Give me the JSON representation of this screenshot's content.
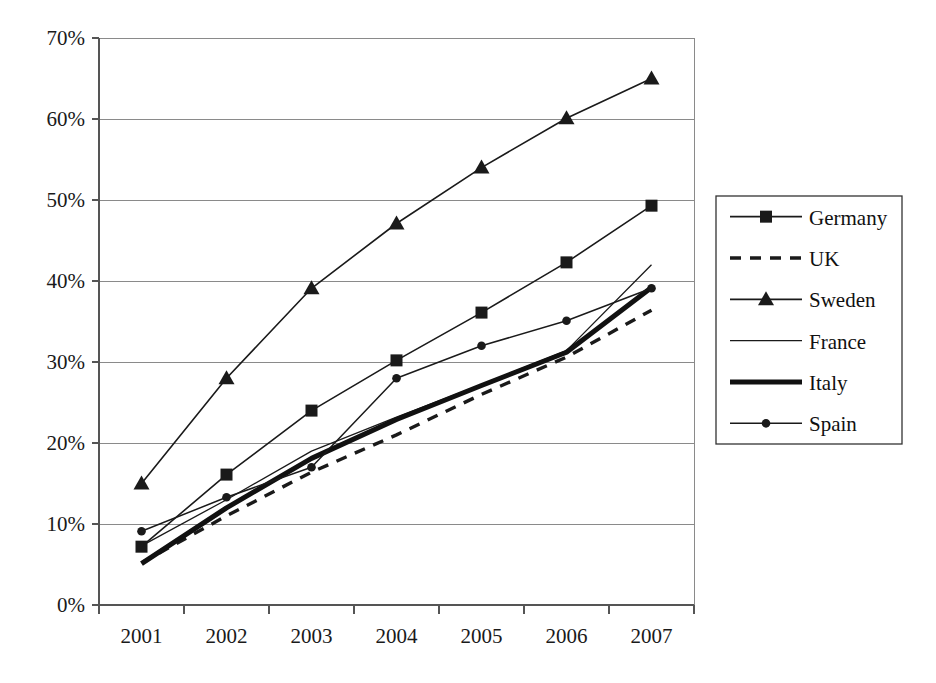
{
  "chart_data": {
    "type": "line",
    "title": "",
    "subtitle": "",
    "xlabel": "",
    "ylabel": "",
    "categories": [
      "2001",
      "2002",
      "2003",
      "2004",
      "2005",
      "2006",
      "2007"
    ],
    "x_tick_labels": [
      "2001",
      "2002",
      "2003",
      "2004",
      "2005",
      "2006",
      "2007"
    ],
    "y_tick_labels": [
      "0%",
      "10%",
      "20%",
      "30%",
      "40%",
      "50%",
      "60%",
      "70%"
    ],
    "y_tick_values": [
      0,
      10,
      20,
      30,
      40,
      50,
      60,
      70
    ],
    "ylim": [
      0,
      70
    ],
    "grid": "horizontal",
    "legend_position": "right",
    "value_unit": "percent",
    "series": [
      {
        "name": "Germany",
        "marker": "square",
        "line_style": "solid",
        "line_width": 1.6,
        "color": "#1a1a1a",
        "values": [
          7.2,
          16.1,
          24.0,
          30.2,
          36.1,
          42.3,
          49.3
        ]
      },
      {
        "name": "UK",
        "marker": "none",
        "line_style": "dashed",
        "line_width": 3.4,
        "color": "#1a1a1a",
        "values": [
          5.2,
          11.0,
          16.4,
          21.0,
          26.0,
          30.6,
          36.4
        ]
      },
      {
        "name": "Sweden",
        "marker": "triangle",
        "line_style": "solid",
        "line_width": 1.6,
        "color": "#1a1a1a",
        "values": [
          15.0,
          28.0,
          39.1,
          47.1,
          54.0,
          60.1,
          65.0
        ]
      },
      {
        "name": "France",
        "marker": "none",
        "line_style": "solid",
        "line_width": 1.3,
        "color": "#1a1a1a",
        "values": [
          7.3,
          13.0,
          19.0,
          23.2,
          27.2,
          31.4,
          42.0
        ]
      },
      {
        "name": "Italy",
        "marker": "none",
        "line_style": "solid",
        "line_width": 5.0,
        "color": "#111111",
        "values": [
          5.1,
          12.0,
          18.1,
          22.9,
          27.1,
          31.2,
          39.2
        ]
      },
      {
        "name": "Spain",
        "marker": "dot",
        "line_style": "solid",
        "line_width": 1.5,
        "color": "#1a1a1a",
        "values": [
          9.1,
          13.3,
          17.0,
          28.0,
          32.0,
          35.1,
          39.1
        ]
      }
    ]
  },
  "legend": {
    "entries": [
      {
        "label": "Germany"
      },
      {
        "label": "UK"
      },
      {
        "label": "Sweden"
      },
      {
        "label": "France"
      },
      {
        "label": "Italy"
      },
      {
        "label": "Spain"
      }
    ]
  },
  "colors": {
    "ink": "#1a1a1a",
    "grid": "#8a8a8a",
    "axis": "#555555",
    "background": "#ffffff"
  }
}
